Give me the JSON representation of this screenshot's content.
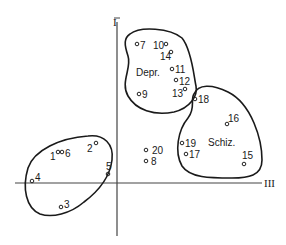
{
  "diagram": {
    "type": "cluster-scatter",
    "axes": {
      "vertical": {
        "label": "I"
      },
      "horizontal": {
        "label": "III"
      }
    },
    "groups": [
      {
        "name": "Depr.",
        "label": "Depr.",
        "members": [
          "7",
          "10",
          "14",
          "11",
          "12",
          "13",
          "9"
        ]
      },
      {
        "name": "Schiz.",
        "label": "Schiz.",
        "members": [
          "18",
          "16",
          "19",
          "17",
          "15"
        ]
      },
      {
        "name": "unlabeled",
        "label": "",
        "members": [
          "1",
          "6",
          "2",
          "4",
          "5",
          "3"
        ]
      }
    ],
    "points": [
      {
        "id": "1",
        "label": "1",
        "x": 58,
        "y": 152
      },
      {
        "id": "2",
        "label": "2",
        "x": 96,
        "y": 143
      },
      {
        "id": "3",
        "label": "3",
        "x": 61,
        "y": 207
      },
      {
        "id": "4",
        "label": "4",
        "x": 32,
        "y": 181
      },
      {
        "id": "5",
        "label": "5",
        "x": 108,
        "y": 174
      },
      {
        "id": "6",
        "label": "6",
        "x": 62,
        "y": 152
      },
      {
        "id": "7",
        "label": "7",
        "x": 137,
        "y": 44
      },
      {
        "id": "8",
        "label": "8",
        "x": 146,
        "y": 161
      },
      {
        "id": "9",
        "label": "9",
        "x": 139,
        "y": 94
      },
      {
        "id": "10",
        "label": "10",
        "x": 166,
        "y": 44
      },
      {
        "id": "11",
        "label": "11",
        "x": 172,
        "y": 69
      },
      {
        "id": "12",
        "label": "12",
        "x": 176,
        "y": 80
      },
      {
        "id": "13",
        "label": "13",
        "x": 185,
        "y": 89
      },
      {
        "id": "14",
        "label": "14",
        "x": 171,
        "y": 52
      },
      {
        "id": "15",
        "label": "15",
        "x": 244,
        "y": 164
      },
      {
        "id": "16",
        "label": "16",
        "x": 227,
        "y": 124
      },
      {
        "id": "17",
        "label": "17",
        "x": 186,
        "y": 154
      },
      {
        "id": "18",
        "label": "18",
        "x": 195,
        "y": 99
      },
      {
        "id": "19",
        "label": "19",
        "x": 182,
        "y": 143
      },
      {
        "id": "20",
        "label": "20",
        "x": 146,
        "y": 150
      }
    ]
  }
}
